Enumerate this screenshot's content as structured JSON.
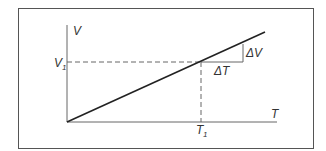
{
  "diagram": {
    "labels": {
      "y_axis": "V",
      "x_axis": "T",
      "v1_main": "V",
      "v1_sub": "1",
      "t1_main": "T",
      "t1_sub": "1",
      "delta_v": "ΔV",
      "delta_t": "ΔT"
    },
    "colors": {
      "frame": "#555555",
      "axis": "#666666",
      "line": "#222222",
      "dashed": "#666666",
      "triangle": "#666666"
    }
  }
}
